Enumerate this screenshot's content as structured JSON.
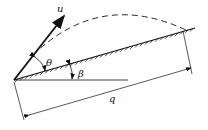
{
  "diagram": {
    "labels": {
      "velocity": "u",
      "launch_angle": "θ",
      "incline_angle": "β",
      "range": "q"
    },
    "colors": {
      "line": "#111111",
      "background": "#ffffff"
    }
  }
}
